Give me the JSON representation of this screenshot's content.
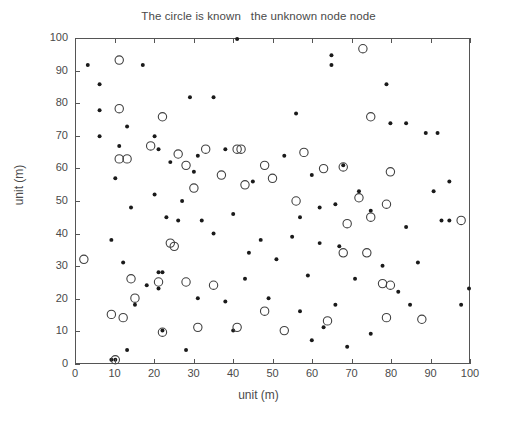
{
  "chart_data": {
    "type": "scatter",
    "title": "The circle is known   the unknown node node",
    "xlabel": "unit (m)",
    "ylabel": "unit (m)",
    "xlim": [
      0,
      100
    ],
    "ylim": [
      0,
      100
    ],
    "xticks": [
      0,
      10,
      20,
      30,
      40,
      50,
      60,
      70,
      80,
      90,
      100
    ],
    "yticks": [
      0,
      10,
      20,
      30,
      40,
      50,
      60,
      70,
      80,
      90,
      100
    ],
    "grid": false,
    "legend": "none",
    "series": [
      {
        "name": "unknown node",
        "marker": "filled-dot",
        "color": "#1a1a1a",
        "points": [
          [
            3,
            92
          ],
          [
            17,
            92
          ],
          [
            6,
            86
          ],
          [
            41,
            100
          ],
          [
            65,
            95
          ],
          [
            65,
            92
          ],
          [
            6,
            78
          ],
          [
            13,
            73
          ],
          [
            29,
            82
          ],
          [
            35,
            82
          ],
          [
            6,
            70
          ],
          [
            20,
            70
          ],
          [
            56,
            77
          ],
          [
            79,
            86
          ],
          [
            11,
            67
          ],
          [
            21,
            66
          ],
          [
            24,
            62
          ],
          [
            31,
            64
          ],
          [
            38,
            66
          ],
          [
            53,
            64
          ],
          [
            80,
            74
          ],
          [
            84,
            74
          ],
          [
            10,
            57
          ],
          [
            30,
            59
          ],
          [
            45,
            56
          ],
          [
            60,
            58
          ],
          [
            68,
            61
          ],
          [
            89,
            71
          ],
          [
            92,
            71
          ],
          [
            20,
            52
          ],
          [
            27,
            50
          ],
          [
            23,
            45
          ],
          [
            26,
            44
          ],
          [
            32,
            44
          ],
          [
            40,
            46
          ],
          [
            35,
            40
          ],
          [
            57,
            45
          ],
          [
            62,
            48
          ],
          [
            66,
            49
          ],
          [
            72,
            53
          ],
          [
            75,
            47
          ],
          [
            91,
            53
          ],
          [
            95,
            56
          ],
          [
            14,
            48
          ],
          [
            9,
            38
          ],
          [
            47,
            38
          ],
          [
            55,
            39
          ],
          [
            62,
            37
          ],
          [
            84,
            42
          ],
          [
            93,
            44
          ],
          [
            95,
            44
          ],
          [
            12,
            31
          ],
          [
            21,
            28
          ],
          [
            22,
            28
          ],
          [
            44,
            34
          ],
          [
            51,
            32
          ],
          [
            67,
            36
          ],
          [
            78,
            30
          ],
          [
            87,
            31
          ],
          [
            18,
            24
          ],
          [
            21,
            23
          ],
          [
            43,
            26
          ],
          [
            59,
            27
          ],
          [
            71,
            26
          ],
          [
            82,
            22
          ],
          [
            100,
            23
          ],
          [
            15,
            18
          ],
          [
            31,
            20
          ],
          [
            38,
            19
          ],
          [
            49,
            20
          ],
          [
            57,
            16
          ],
          [
            66,
            18
          ],
          [
            85,
            18
          ],
          [
            98,
            18
          ],
          [
            22,
            10
          ],
          [
            13,
            4
          ],
          [
            28,
            4
          ],
          [
            40,
            10
          ],
          [
            60,
            7
          ],
          [
            63,
            11
          ],
          [
            69,
            5
          ],
          [
            75,
            9
          ],
          [
            9,
            1
          ],
          [
            10,
            1
          ]
        ]
      },
      {
        "name": "known (anchor) node",
        "marker": "open-circle",
        "color": "#404040",
        "points": [
          [
            11,
            93.5
          ],
          [
            73,
            97
          ],
          [
            11,
            78.5
          ],
          [
            22,
            76
          ],
          [
            75,
            76
          ],
          [
            11,
            63
          ],
          [
            13,
            63
          ],
          [
            19,
            67
          ],
          [
            26,
            64.5
          ],
          [
            33,
            66
          ],
          [
            41,
            66
          ],
          [
            42,
            66
          ],
          [
            48,
            61
          ],
          [
            58,
            65
          ],
          [
            68,
            60.5
          ],
          [
            28,
            61
          ],
          [
            37,
            58
          ],
          [
            50,
            57
          ],
          [
            63,
            60
          ],
          [
            80,
            59
          ],
          [
            30,
            54
          ],
          [
            43,
            55
          ],
          [
            56,
            50
          ],
          [
            72,
            51
          ],
          [
            79,
            49
          ],
          [
            98,
            44
          ],
          [
            2,
            32
          ],
          [
            24,
            37
          ],
          [
            25,
            36
          ],
          [
            69,
            43
          ],
          [
            75,
            45
          ],
          [
            68,
            34
          ],
          [
            74,
            34
          ],
          [
            14,
            26
          ],
          [
            21,
            25
          ],
          [
            28,
            25
          ],
          [
            35,
            24
          ],
          [
            78,
            24.5
          ],
          [
            80,
            24
          ],
          [
            9,
            15
          ],
          [
            12,
            14
          ],
          [
            15,
            20
          ],
          [
            31,
            11
          ],
          [
            41,
            11
          ],
          [
            48,
            16
          ],
          [
            53,
            10
          ],
          [
            64,
            13
          ],
          [
            79,
            14
          ],
          [
            88,
            13.5
          ],
          [
            22,
            9.5
          ],
          [
            10,
            1
          ]
        ]
      }
    ]
  },
  "axis": {
    "x_tick_labels": [
      "0",
      "10",
      "20",
      "30",
      "40",
      "50",
      "60",
      "70",
      "80",
      "90",
      "100"
    ],
    "y_tick_labels": [
      "0",
      "10",
      "20",
      "30",
      "40",
      "50",
      "60",
      "70",
      "80",
      "90",
      "100"
    ]
  }
}
